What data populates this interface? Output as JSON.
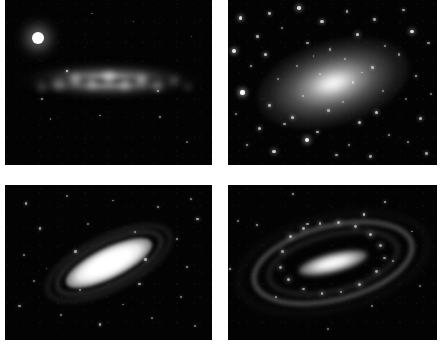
{
  "figure": {
    "background_color": "#ffffff",
    "gutter_color": "#ffffff",
    "sky_color": "#030303",
    "columns": 2,
    "rows": 2,
    "width": 447,
    "height": 353
  },
  "panels": [
    {
      "id": "panel-top-left",
      "position": "top-left",
      "galaxy_type": "edge-on starburst spiral",
      "description": "Bright clumpy edge-on disk crossed by a dark dust lane, with a brilliant foreground star at upper left",
      "rect": {
        "x": 5,
        "y": 0,
        "w": 207,
        "h": 165
      },
      "features": {
        "disk_angle_deg": 0,
        "has_dust_lane": true,
        "bright_foreground_star": true
      },
      "stars": [
        {
          "x": 16.0,
          "y": 23.0,
          "r": 6.2,
          "b": 1.0
        },
        {
          "x": 30.0,
          "y": 43.0,
          "r": 1.2,
          "b": 0.8
        },
        {
          "x": 18.0,
          "y": 60.0,
          "r": 0.9,
          "b": 0.55
        },
        {
          "x": 22.0,
          "y": 72.0,
          "r": 0.8,
          "b": 0.45
        },
        {
          "x": 46.0,
          "y": 70.0,
          "r": 0.9,
          "b": 0.5
        },
        {
          "x": 75.0,
          "y": 71.0,
          "r": 0.9,
          "b": 0.5
        },
        {
          "x": 88.0,
          "y": 86.0,
          "r": 0.8,
          "b": 0.4
        },
        {
          "x": 74.0,
          "y": 55.0,
          "r": 1.0,
          "b": 0.6
        },
        {
          "x": 62.0,
          "y": 13.0,
          "r": 0.8,
          "b": 0.4
        },
        {
          "x": 42.0,
          "y": 8.0,
          "r": 0.7,
          "b": 0.35
        },
        {
          "x": 90.0,
          "y": 22.0,
          "r": 0.7,
          "b": 0.35
        }
      ],
      "clumps": [
        {
          "x": 22,
          "y": 48,
          "w": 16,
          "h": 11,
          "b": 0.55
        },
        {
          "x": 31,
          "y": 44,
          "w": 13,
          "h": 13,
          "b": 0.78
        },
        {
          "x": 39,
          "y": 47,
          "w": 12,
          "h": 11,
          "b": 0.68
        },
        {
          "x": 47,
          "y": 43,
          "w": 14,
          "h": 13,
          "b": 0.85
        },
        {
          "x": 55,
          "y": 48,
          "w": 12,
          "h": 11,
          "b": 0.72
        },
        {
          "x": 63,
          "y": 45,
          "w": 13,
          "h": 12,
          "b": 0.8
        },
        {
          "x": 71,
          "y": 49,
          "w": 11,
          "h": 10,
          "b": 0.6
        },
        {
          "x": 79,
          "y": 46,
          "w": 10,
          "h": 9,
          "b": 0.45
        },
        {
          "x": 15,
          "y": 50,
          "w": 12,
          "h": 9,
          "b": 0.35
        },
        {
          "x": 86,
          "y": 50,
          "w": 10,
          "h": 8,
          "b": 0.3
        }
      ]
    },
    {
      "id": "panel-top-right",
      "position": "top-right",
      "galaxy_type": "elliptical galaxy",
      "description": "Smooth featureless elliptical with a bright nucleus embedded in a very rich field of resolved stars",
      "rect": {
        "x": 228,
        "y": 0,
        "w": 209,
        "h": 165
      },
      "features": {
        "ellipse_angle_deg": -16,
        "rich_starfield": true
      },
      "stars": [
        {
          "x": 6,
          "y": 11,
          "r": 1.8,
          "b": 0.85
        },
        {
          "x": 14,
          "y": 22,
          "r": 1.3,
          "b": 0.65
        },
        {
          "x": 3,
          "y": 31,
          "r": 1.9,
          "b": 0.9
        },
        {
          "x": 11,
          "y": 40,
          "r": 1.2,
          "b": 0.6
        },
        {
          "x": 7,
          "y": 56,
          "r": 2.2,
          "b": 1.0
        },
        {
          "x": 4,
          "y": 69,
          "r": 1.1,
          "b": 0.5
        },
        {
          "x": 15,
          "y": 78,
          "r": 1.5,
          "b": 0.7
        },
        {
          "x": 9,
          "y": 88,
          "r": 1.3,
          "b": 0.6
        },
        {
          "x": 20,
          "y": 8,
          "r": 1.4,
          "b": 0.7
        },
        {
          "x": 26,
          "y": 17,
          "r": 1.1,
          "b": 0.5
        },
        {
          "x": 18,
          "y": 33,
          "r": 1.6,
          "b": 0.75
        },
        {
          "x": 24,
          "y": 48,
          "r": 1.0,
          "b": 0.45
        },
        {
          "x": 20,
          "y": 64,
          "r": 1.4,
          "b": 0.7
        },
        {
          "x": 27,
          "y": 75,
          "r": 1.2,
          "b": 0.55
        },
        {
          "x": 22,
          "y": 92,
          "r": 1.7,
          "b": 0.8
        },
        {
          "x": 34,
          "y": 5,
          "r": 1.8,
          "b": 0.85
        },
        {
          "x": 38,
          "y": 26,
          "r": 1.2,
          "b": 0.6
        },
        {
          "x": 33,
          "y": 40,
          "r": 1.0,
          "b": 0.45
        },
        {
          "x": 36,
          "y": 58,
          "r": 1.1,
          "b": 0.5
        },
        {
          "x": 31,
          "y": 71,
          "r": 1.5,
          "b": 0.7
        },
        {
          "x": 38,
          "y": 85,
          "r": 2.0,
          "b": 0.95
        },
        {
          "x": 45,
          "y": 13,
          "r": 1.6,
          "b": 0.75
        },
        {
          "x": 49,
          "y": 30,
          "r": 1.1,
          "b": 0.5
        },
        {
          "x": 44,
          "y": 45,
          "r": 0.9,
          "b": 0.4
        },
        {
          "x": 48,
          "y": 67,
          "r": 1.2,
          "b": 0.55
        },
        {
          "x": 43,
          "y": 80,
          "r": 1.4,
          "b": 0.65
        },
        {
          "x": 52,
          "y": 94,
          "r": 1.3,
          "b": 0.6
        },
        {
          "x": 57,
          "y": 7,
          "r": 1.3,
          "b": 0.6
        },
        {
          "x": 62,
          "y": 21,
          "r": 1.7,
          "b": 0.8
        },
        {
          "x": 56,
          "y": 36,
          "r": 1.0,
          "b": 0.45
        },
        {
          "x": 60,
          "y": 50,
          "r": 1.1,
          "b": 0.5
        },
        {
          "x": 55,
          "y": 62,
          "r": 0.9,
          "b": 0.4
        },
        {
          "x": 63,
          "y": 74,
          "r": 1.5,
          "b": 0.7
        },
        {
          "x": 58,
          "y": 88,
          "r": 1.2,
          "b": 0.55
        },
        {
          "x": 70,
          "y": 12,
          "r": 1.4,
          "b": 0.65
        },
        {
          "x": 75,
          "y": 28,
          "r": 1.1,
          "b": 0.5
        },
        {
          "x": 69,
          "y": 41,
          "r": 1.3,
          "b": 0.6
        },
        {
          "x": 74,
          "y": 55,
          "r": 1.0,
          "b": 0.45
        },
        {
          "x": 71,
          "y": 68,
          "r": 1.6,
          "b": 0.75
        },
        {
          "x": 77,
          "y": 82,
          "r": 1.2,
          "b": 0.55
        },
        {
          "x": 68,
          "y": 95,
          "r": 1.4,
          "b": 0.65
        },
        {
          "x": 84,
          "y": 6,
          "r": 1.3,
          "b": 0.6
        },
        {
          "x": 88,
          "y": 19,
          "r": 1.8,
          "b": 0.85
        },
        {
          "x": 82,
          "y": 33,
          "r": 1.1,
          "b": 0.5
        },
        {
          "x": 90,
          "y": 46,
          "r": 1.4,
          "b": 0.65
        },
        {
          "x": 85,
          "y": 60,
          "r": 1.0,
          "b": 0.45
        },
        {
          "x": 92,
          "y": 72,
          "r": 1.5,
          "b": 0.7
        },
        {
          "x": 86,
          "y": 86,
          "r": 1.2,
          "b": 0.55
        },
        {
          "x": 95,
          "y": 93,
          "r": 1.3,
          "b": 0.6
        },
        {
          "x": 96,
          "y": 26,
          "r": 1.2,
          "b": 0.55
        },
        {
          "x": 97,
          "y": 57,
          "r": 1.1,
          "b": 0.5
        },
        {
          "x": 51,
          "y": 53,
          "r": 0.8,
          "b": 0.4
        },
        {
          "x": 64,
          "y": 44,
          "r": 0.8,
          "b": 0.4
        },
        {
          "x": 41,
          "y": 34,
          "r": 0.8,
          "b": 0.4
        }
      ]
    },
    {
      "id": "panel-bottom-left",
      "position": "bottom-left",
      "galaxy_type": "inclined spiral galaxy",
      "description": "Highly inclined spiral with an over-exposed white central disk and faint surrounding arms, in a sparse star field",
      "rect": {
        "x": 5,
        "y": 185,
        "w": 207,
        "h": 155
      },
      "features": {
        "disk_angle_deg": -26,
        "saturated_core": true,
        "sparse_starfield": true
      },
      "stars": [
        {
          "x": 10,
          "y": 12,
          "r": 1.2,
          "b": 0.6
        },
        {
          "x": 30,
          "y": 7,
          "r": 1.0,
          "b": 0.5
        },
        {
          "x": 52,
          "y": 10,
          "r": 0.9,
          "b": 0.45
        },
        {
          "x": 74,
          "y": 14,
          "r": 1.1,
          "b": 0.55
        },
        {
          "x": 90,
          "y": 9,
          "r": 1.0,
          "b": 0.5
        },
        {
          "x": 93,
          "y": 22,
          "r": 1.3,
          "b": 0.65
        },
        {
          "x": 17,
          "y": 28,
          "r": 1.2,
          "b": 0.6
        },
        {
          "x": 40,
          "y": 25,
          "r": 0.9,
          "b": 0.45
        },
        {
          "x": 63,
          "y": 30,
          "r": 1.0,
          "b": 0.5
        },
        {
          "x": 83,
          "y": 35,
          "r": 1.1,
          "b": 0.55
        },
        {
          "x": 9,
          "y": 45,
          "r": 1.0,
          "b": 0.5
        },
        {
          "x": 34,
          "y": 43,
          "r": 1.2,
          "b": 0.6
        },
        {
          "x": 68,
          "y": 48,
          "r": 1.3,
          "b": 0.65
        },
        {
          "x": 88,
          "y": 53,
          "r": 1.1,
          "b": 0.55
        },
        {
          "x": 14,
          "y": 62,
          "r": 0.9,
          "b": 0.45
        },
        {
          "x": 36,
          "y": 68,
          "r": 1.0,
          "b": 0.5
        },
        {
          "x": 65,
          "y": 64,
          "r": 1.2,
          "b": 0.6
        },
        {
          "x": 85,
          "y": 72,
          "r": 1.0,
          "b": 0.5
        },
        {
          "x": 7,
          "y": 78,
          "r": 1.1,
          "b": 0.55
        },
        {
          "x": 27,
          "y": 84,
          "r": 1.0,
          "b": 0.5
        },
        {
          "x": 46,
          "y": 90,
          "r": 1.2,
          "b": 0.6
        },
        {
          "x": 71,
          "y": 86,
          "r": 0.9,
          "b": 0.45
        },
        {
          "x": 92,
          "y": 91,
          "r": 1.0,
          "b": 0.5
        },
        {
          "x": 20,
          "y": 54,
          "r": 0.8,
          "b": 0.4
        },
        {
          "x": 57,
          "y": 77,
          "r": 0.8,
          "b": 0.4
        }
      ]
    },
    {
      "id": "panel-bottom-right",
      "position": "bottom-right",
      "galaxy_type": "barred spiral galaxy",
      "description": "Barred spiral with a bright elongated bar and knotty ring-like arms wrapping around the nucleus",
      "rect": {
        "x": 228,
        "y": 185,
        "w": 209,
        "h": 155
      },
      "features": {
        "bar_angle_deg": -14,
        "ring_arms": true,
        "knotty_arms": true
      },
      "stars": [
        {
          "x": 31,
          "y": 6,
          "r": 1.1,
          "b": 0.6
        },
        {
          "x": 75,
          "y": 11,
          "r": 1.2,
          "b": 0.65
        },
        {
          "x": 5,
          "y": 23,
          "r": 1.0,
          "b": 0.5
        },
        {
          "x": 14,
          "y": 26,
          "r": 1.2,
          "b": 0.6
        },
        {
          "x": 65,
          "y": 19,
          "r": 1.3,
          "b": 0.7
        },
        {
          "x": 38,
          "y": 25,
          "r": 1.1,
          "b": 0.55
        },
        {
          "x": 1,
          "y": 54,
          "r": 1.2,
          "b": 0.6
        },
        {
          "x": 79,
          "y": 49,
          "r": 1.0,
          "b": 0.5
        },
        {
          "x": 23,
          "y": 72,
          "r": 1.1,
          "b": 0.55
        },
        {
          "x": 69,
          "y": 78,
          "r": 1.0,
          "b": 0.5
        },
        {
          "x": 92,
          "y": 65,
          "r": 0.9,
          "b": 0.45
        },
        {
          "x": 48,
          "y": 93,
          "r": 0.9,
          "b": 0.45
        },
        {
          "x": 88,
          "y": 30,
          "r": 0.9,
          "b": 0.45
        }
      ],
      "knots": [
        {
          "x": 30,
          "y": 33,
          "r": 1.6,
          "b": 0.85
        },
        {
          "x": 36,
          "y": 28,
          "r": 1.4,
          "b": 0.8
        },
        {
          "x": 44,
          "y": 25,
          "r": 1.3,
          "b": 0.75
        },
        {
          "x": 53,
          "y": 24,
          "r": 1.5,
          "b": 0.8
        },
        {
          "x": 61,
          "y": 27,
          "r": 1.4,
          "b": 0.75
        },
        {
          "x": 68,
          "y": 32,
          "r": 1.6,
          "b": 0.85
        },
        {
          "x": 73,
          "y": 39,
          "r": 1.5,
          "b": 0.8
        },
        {
          "x": 75,
          "y": 47,
          "r": 1.3,
          "b": 0.7
        },
        {
          "x": 71,
          "y": 56,
          "r": 1.4,
          "b": 0.75
        },
        {
          "x": 63,
          "y": 64,
          "r": 1.5,
          "b": 0.8
        },
        {
          "x": 54,
          "y": 69,
          "r": 1.3,
          "b": 0.7
        },
        {
          "x": 45,
          "y": 70,
          "r": 1.4,
          "b": 0.75
        },
        {
          "x": 36,
          "y": 67,
          "r": 1.3,
          "b": 0.7
        },
        {
          "x": 29,
          "y": 61,
          "r": 1.5,
          "b": 0.8
        },
        {
          "x": 25,
          "y": 53,
          "r": 1.4,
          "b": 0.75
        },
        {
          "x": 26,
          "y": 43,
          "r": 1.3,
          "b": 0.7
        }
      ]
    }
  ]
}
